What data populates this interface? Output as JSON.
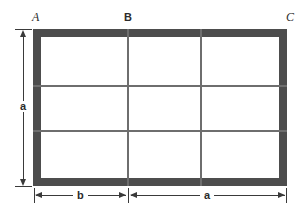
{
  "figure": {
    "background_color": "#ffffff",
    "frame_color": "#4d4d4d",
    "grid_line_color": "#6e6e6e",
    "dimension_color": "#3a3a3a"
  },
  "point_labels": [
    {
      "id": "A",
      "text": "A",
      "style": "italic",
      "position": "top-left"
    },
    {
      "id": "B",
      "text": "B",
      "style": "upright",
      "position": "top-middle"
    },
    {
      "id": "C",
      "text": "C",
      "style": "italic",
      "position": "top-right"
    }
  ],
  "dimensions": [
    {
      "id": "height-a",
      "label": "a",
      "orientation": "vertical",
      "location": "left",
      "spans": "full height of rectangle"
    },
    {
      "id": "width-b",
      "label": "b",
      "orientation": "horizontal",
      "location": "bottom-left",
      "spans": "left edge to point B"
    },
    {
      "id": "width-a",
      "label": "a",
      "orientation": "horizontal",
      "location": "bottom-right",
      "spans": "point B to right edge"
    }
  ],
  "grid": {
    "rows": 3,
    "columns": 3,
    "vertical_line_count": 2,
    "horizontal_line_count": 2
  }
}
